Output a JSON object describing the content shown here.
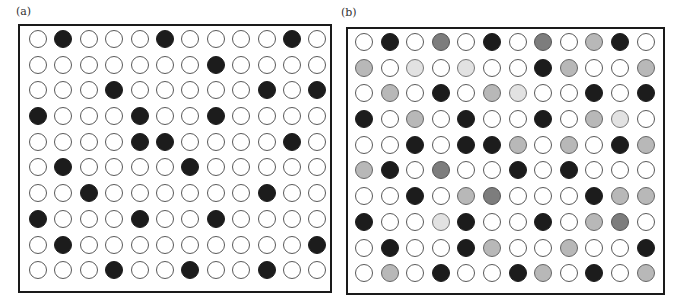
{
  "figure": {
    "panels": [
      {
        "id": "a",
        "label": "(a)",
        "description": "10x12 grid of circles, binary: white (open) or black (filled)",
        "legend_key": {
          "W": "white / open",
          "B": "black / filled"
        },
        "rows": [
          "WBWWWBWWWWBW",
          "WWWWWWWBWWWW",
          "WWWBWWWWWBWB",
          "BWWWBWWBWWWW",
          "WWWWBBWWWWBW",
          "WBWWWWBWWWWW",
          "WWBWWWWWWBWW",
          "BWWWBWWBWWWW",
          "WBWWWWWWWWWB",
          "WWWBWWBWWBWW"
        ]
      },
      {
        "id": "b",
        "label": "(b)",
        "description": "10x12 grid of circles with graded shading: white, very light grey, light grey, mid grey, black",
        "legend_key": {
          "W": "white",
          "L": "very light grey",
          "G": "light grey",
          "M": "mid grey",
          "B": "black"
        },
        "rows": [
          "WBWMWBWMWGBW",
          "GWLWLWWBGWWG",
          "WGWBWGLWWBWB",
          "BWGWBWWBWGLW",
          "WWBWBBGWGWBG",
          "GBWMWWBWBWWW",
          "WWBWGMWWWBGG",
          "BWWLBWWBWGMW",
          "WBWWBGWWGWWB",
          "WGWBWWBGWBWG"
        ]
      }
    ],
    "colors": {
      "W": "#ffffff",
      "L": "#e2e2e2",
      "G": "#b8b8b8",
      "M": "#7d7d7d",
      "B": "#1c1c1c",
      "border": "#1a1a1a"
    }
  }
}
